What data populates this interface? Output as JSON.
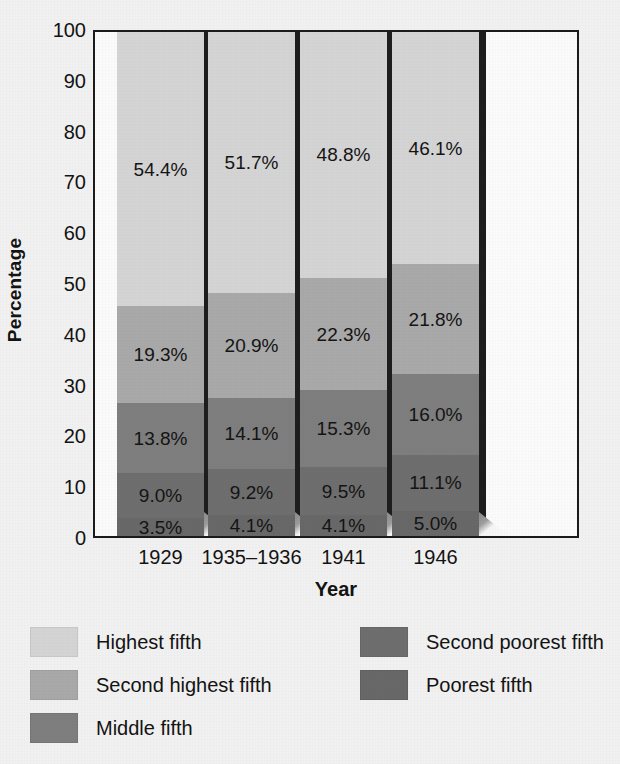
{
  "chart_data": {
    "type": "bar",
    "subtype": "stacked-bar-100",
    "title": "",
    "xlabel": "Year",
    "ylabel": "Percentage",
    "ylim": [
      0,
      100
    ],
    "yticks": [
      0,
      10,
      20,
      30,
      40,
      50,
      60,
      70,
      80,
      90,
      100
    ],
    "ytick_labels": [
      "0",
      "10",
      "20",
      "30",
      "40",
      "50",
      "60",
      "70",
      "80",
      "90",
      "100"
    ],
    "grid": false,
    "legend_position": "bottom",
    "categories": [
      "1929",
      "1935–1936",
      "1941",
      "1946"
    ],
    "series": [
      {
        "name": "Highest fifth",
        "color": "#d4d4d4",
        "values": [
          54.4,
          51.7,
          48.8,
          46.1
        ],
        "labels": [
          "54.4%",
          "51.7%",
          "48.8%",
          "46.1%"
        ]
      },
      {
        "name": "Second highest fifth",
        "color": "#a9a9a9",
        "values": [
          19.3,
          20.9,
          22.3,
          21.8
        ],
        "labels": [
          "19.3%",
          "20.9%",
          "22.3%",
          "21.8%"
        ]
      },
      {
        "name": "Middle fifth",
        "color": "#7e7e7e",
        "values": [
          13.8,
          14.1,
          15.3,
          16.0
        ],
        "labels": [
          "13.8%",
          "14.1%",
          "15.3%",
          "16.0%"
        ]
      },
      {
        "name": "Second poorest fifth",
        "color": "#6e6e6e",
        "values": [
          9.0,
          9.2,
          9.5,
          11.1
        ],
        "labels": [
          "9.0%",
          "9.2%",
          "9.5%",
          "11.1%"
        ]
      },
      {
        "name": "Poorest fifth",
        "color": "#686868",
        "values": [
          3.5,
          4.1,
          4.1,
          5.0
        ],
        "labels": [
          "3.5%",
          "4.1%",
          "4.1%",
          "5.0%"
        ]
      }
    ]
  },
  "axes": {
    "y_title": "Percentage",
    "x_title": "Year"
  },
  "legend": {
    "left_column": [
      {
        "label": "Highest fifth",
        "color": "#d4d4d4"
      },
      {
        "label": "Second highest fifth",
        "color": "#a9a9a9"
      },
      {
        "label": "Middle fifth",
        "color": "#7e7e7e"
      }
    ],
    "right_column": [
      {
        "label": "Second poorest fifth",
        "color": "#6e6e6e"
      },
      {
        "label": "Poorest fifth",
        "color": "#686868"
      }
    ]
  },
  "colors": {
    "background": "#f1f1f1",
    "plot_background": "#fbfbfb",
    "axis_line": "#1b1b1b",
    "text": "#131313",
    "bar_shadow": "#1d1d1d"
  }
}
